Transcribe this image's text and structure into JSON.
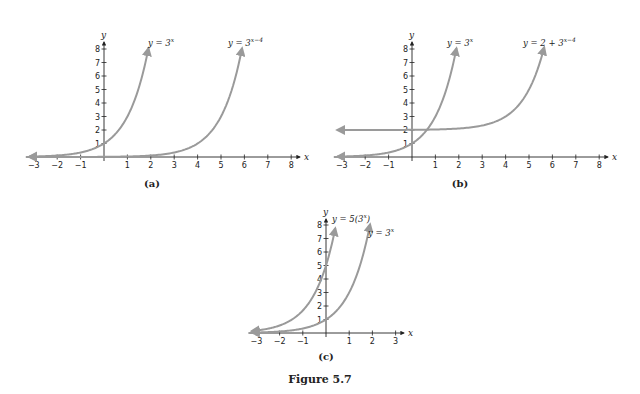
{
  "figure": {
    "caption": "Figure 5.7"
  },
  "colors": {
    "curve": "#9a9a9a",
    "axis": "#222222"
  },
  "chart_data": [
    {
      "type": "line",
      "panel": "(a)",
      "xlabel": "x",
      "ylabel": "y",
      "xlim": [
        -3,
        8
      ],
      "ylim": [
        0,
        8
      ],
      "x_ticks": [
        -3,
        -2,
        -1,
        1,
        2,
        3,
        4,
        5,
        6,
        7,
        8
      ],
      "y_ticks": [
        1,
        2,
        3,
        4,
        5,
        6,
        7,
        8
      ],
      "grid": false,
      "series": [
        {
          "name": "y = 3^x",
          "label_main": "y = 3",
          "label_sup": "x",
          "expr": "3^x",
          "x_range": [
            -3.2,
            1.9
          ]
        },
        {
          "name": "y = 3^(x−4)",
          "label_main": "y = 3",
          "label_sup": "x−4",
          "expr": "3^(x-4)",
          "x_range": [
            -3.2,
            5.9
          ]
        }
      ]
    },
    {
      "type": "line",
      "panel": "(b)",
      "xlabel": "x",
      "ylabel": "y",
      "xlim": [
        -3,
        8
      ],
      "ylim": [
        0,
        8
      ],
      "x_ticks": [
        -3,
        -2,
        -1,
        1,
        2,
        3,
        4,
        5,
        6,
        7,
        8
      ],
      "y_ticks": [
        1,
        2,
        3,
        4,
        5,
        6,
        7,
        8
      ],
      "grid": false,
      "series": [
        {
          "name": "y = 3^x",
          "label_main": "y = 3",
          "label_sup": "x",
          "expr": "3^x",
          "x_range": [
            -3.2,
            1.9
          ]
        },
        {
          "name": "y = 2 + 3^(x−4)",
          "label_main": "y = 2 + 3",
          "label_sup": "x−4",
          "expr": "2+3^(x-4)",
          "x_range": [
            -3.2,
            5.65
          ]
        }
      ]
    },
    {
      "type": "line",
      "panel": "(c)",
      "xlabel": "x",
      "ylabel": "y",
      "xlim": [
        -3,
        3
      ],
      "ylim": [
        0,
        8
      ],
      "x_ticks": [
        -3,
        -2,
        -1,
        1,
        2,
        3
      ],
      "y_ticks": [
        1,
        2,
        3,
        4,
        5,
        6,
        7,
        8
      ],
      "grid": false,
      "series": [
        {
          "name": "y = 5(3^x)",
          "label_main": "y = 5(3",
          "label_sup": "x",
          "label_tail": ")",
          "expr": "5*3^x",
          "x_range": [
            -3.2,
            0.4
          ]
        },
        {
          "name": "y = 3^x",
          "label_main": "y = 3",
          "label_sup": "x",
          "expr": "3^x",
          "x_range": [
            -3.2,
            1.9
          ]
        }
      ]
    }
  ]
}
